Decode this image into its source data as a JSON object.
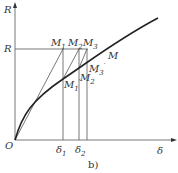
{
  "diagram": {
    "caption": "b)",
    "axes": {
      "x_label": "δ",
      "y_label": "R",
      "origin_label": "O"
    },
    "level_label": "R",
    "curve_label": "M",
    "points": {
      "M1": "M",
      "M1_sub": "1",
      "M2": "M",
      "M2_sub": "2",
      "M3": "M",
      "M3_sub": "3",
      "M1p": "M",
      "M1p_sub": "1",
      "M1p_sup": "′",
      "M2p": "M",
      "M2p_sub": "2",
      "M2p_sup": "′",
      "M3p": "M",
      "M3p_sub": "3",
      "M3p_sup": "′"
    },
    "ticks": {
      "d1": "δ",
      "d1_sub": "1",
      "d2": "δ",
      "d2_sub": "2"
    }
  }
}
